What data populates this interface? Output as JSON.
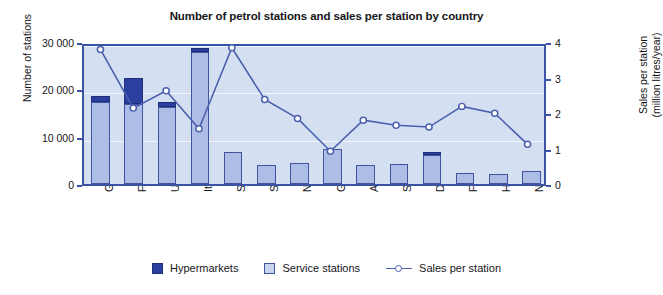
{
  "chart_data": {
    "type": "bar",
    "title": "Number of petrol stations and sales per station by country",
    "xlabel": "",
    "ylabel": "Number of stations",
    "ylabel_right": "Sales per station (million litres/year)",
    "ylim": [
      0,
      30000
    ],
    "ylim_right": [
      0,
      4
    ],
    "yticks": [
      0,
      10000,
      20000,
      30000
    ],
    "ytick_labels": [
      "0",
      "10 000",
      "20 000",
      "30 000"
    ],
    "yticks_right": [
      0,
      1,
      2,
      3,
      4
    ],
    "ytick_labels_right": [
      "0",
      "1",
      "2",
      "3",
      "4"
    ],
    "grid": true,
    "legend_position": "bottom",
    "stacked": true,
    "categories": [
      "Germany",
      "France",
      "UK",
      "Italy",
      "Spain",
      "Sweden",
      "Netherlands",
      "Greece",
      "Austria",
      "Switzerland",
      "Denmark",
      "Finland",
      "Hungary",
      "Norway"
    ],
    "series": [
      {
        "name": "Service stations",
        "color": "#aebde5",
        "values": [
          17300,
          16800,
          16200,
          27900,
          6700,
          4000,
          4400,
          7300,
          4100,
          4200,
          6200,
          2400,
          2200,
          2800
        ]
      },
      {
        "name": "Hypermarkets",
        "color": "#2b3f9e",
        "values": [
          1300,
          5500,
          1100,
          800,
          0,
          0,
          0,
          0,
          0,
          0,
          600,
          0,
          0,
          0
        ]
      }
    ],
    "totals": [
      18600,
      22300,
      17300,
      28700,
      6700,
      4000,
      4400,
      7300,
      4100,
      4200,
      6800,
      2400,
      2200,
      2800
    ],
    "line_series": {
      "name": "Sales per station",
      "color": "#4a5fae",
      "marker": "circle-open",
      "axis": "right",
      "values": [
        3.9,
        2.2,
        2.7,
        1.6,
        3.95,
        2.45,
        1.9,
        0.95,
        1.85,
        1.7,
        1.65,
        2.25,
        2.05,
        1.15
      ]
    }
  },
  "legend": {
    "items": [
      {
        "label": "Hypermarkets",
        "type": "swatch-dark"
      },
      {
        "label": "Service stations",
        "type": "swatch-light"
      },
      {
        "label": "Sales per station",
        "type": "line-marker"
      }
    ]
  },
  "colors": {
    "plot_background": "#d4e0f2",
    "frame": "#3a53a4",
    "gridline": "#f2f6fc",
    "bar_service": "#aebde5",
    "bar_hypermarket": "#2b3f9e",
    "line": "#4a5fae",
    "text": "#16161a"
  }
}
